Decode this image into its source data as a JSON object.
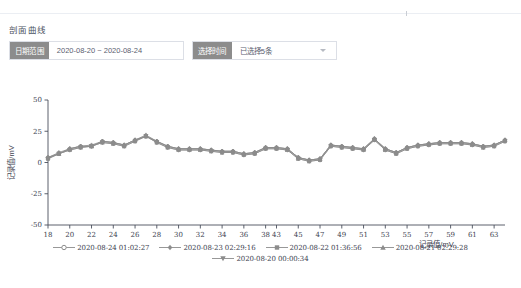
{
  "section": {
    "title": "剖面曲线"
  },
  "filters": {
    "date_range": {
      "label": "日期范围",
      "value": "2020-08-20 ~ 2020-08-24"
    },
    "time_select": {
      "label": "选择时间",
      "value": "已选择5条",
      "icon": "chevron-down-icon"
    }
  },
  "chart_data": {
    "type": "line",
    "title": "",
    "xlabel": "记录值/mV",
    "ylabel": "记录值/mV",
    "ylim": [
      -50,
      50
    ],
    "yticks": [
      50,
      25,
      0,
      -25,
      -50
    ],
    "grid": false,
    "legend_position": "bottom",
    "categories": [
      18,
      19,
      20,
      21,
      22,
      23,
      24,
      25,
      26,
      27,
      28,
      29,
      30,
      31,
      32,
      33,
      34,
      35,
      36,
      37,
      38,
      43,
      44,
      45,
      46,
      47,
      48,
      49,
      50,
      51,
      52,
      53,
      54,
      55,
      56,
      57,
      58,
      59,
      60,
      61,
      62,
      63,
      64
    ],
    "xticks": [
      18,
      20,
      22,
      24,
      26,
      28,
      30,
      32,
      34,
      36,
      38,
      43,
      45,
      47,
      49,
      51,
      53,
      55,
      57,
      59,
      61,
      63
    ],
    "colors": {
      "series": "#8c8c8c",
      "axis": "#3d4250",
      "accent": "#8c8c8c"
    },
    "series": [
      {
        "name": "2020-08-24 01:02:27",
        "marker": "circle",
        "color": "#8c8c8c",
        "values": [
          4,
          7,
          11,
          13,
          13,
          17,
          16,
          14,
          18,
          21,
          17,
          13,
          11,
          11,
          11,
          10,
          9,
          9,
          7,
          8,
          12,
          12,
          11,
          4,
          2,
          3,
          14,
          13,
          12,
          11,
          19,
          11,
          8,
          12,
          14,
          15,
          16,
          16,
          16,
          15,
          13,
          14,
          18
        ]
      },
      {
        "name": "2020-08-23 02:29:16",
        "marker": "diamond",
        "color": "#8c8c8c",
        "values": [
          4,
          8,
          11,
          13,
          14,
          17,
          16,
          14,
          18,
          22,
          17,
          13,
          11,
          11,
          11,
          10,
          9,
          9,
          7,
          8,
          12,
          12,
          11,
          4,
          2,
          3,
          14,
          13,
          12,
          11,
          19,
          11,
          8,
          12,
          14,
          15,
          16,
          16,
          16,
          15,
          13,
          14,
          18
        ]
      },
      {
        "name": "2020-08-22 01:36:56",
        "marker": "square",
        "color": "#8c8c8c",
        "values": [
          3,
          7,
          10,
          12,
          13,
          16,
          15,
          13,
          17,
          21,
          16,
          12,
          10,
          10,
          10,
          9,
          8,
          8,
          6,
          7,
          11,
          11,
          10,
          3,
          1,
          2,
          13,
          12,
          11,
          10,
          18,
          10,
          7,
          11,
          13,
          14,
          15,
          15,
          15,
          14,
          12,
          13,
          17
        ]
      },
      {
        "name": "2020-08-21 02:29:28",
        "marker": "triangle-up",
        "color": "#8c8c8c",
        "values": [
          4,
          7,
          11,
          13,
          13,
          17,
          16,
          14,
          18,
          21,
          17,
          13,
          11,
          11,
          11,
          10,
          9,
          9,
          7,
          8,
          12,
          12,
          11,
          4,
          2,
          3,
          14,
          13,
          12,
          11,
          19,
          11,
          8,
          12,
          14,
          15,
          16,
          16,
          16,
          15,
          13,
          14,
          18
        ]
      },
      {
        "name": "2020-08-20 00:00:34",
        "marker": "triangle-down",
        "color": "#8c8c8c",
        "values": [
          3,
          7,
          10,
          12,
          13,
          16,
          15,
          13,
          17,
          21,
          16,
          12,
          10,
          10,
          10,
          9,
          8,
          8,
          6,
          7,
          11,
          11,
          10,
          3,
          1,
          2,
          13,
          12,
          11,
          10,
          18,
          10,
          7,
          11,
          13,
          14,
          15,
          15,
          15,
          14,
          12,
          13,
          17
        ]
      }
    ]
  }
}
